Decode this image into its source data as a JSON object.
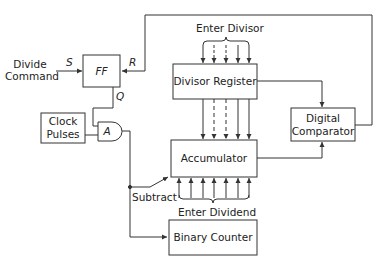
{
  "diagram": {
    "blocks": {
      "flip_flop": {
        "label": "FF",
        "set_input": "S",
        "reset_input": "R",
        "output": "Q"
      },
      "clock": {
        "label_line1": "Clock",
        "label_line2": "Pulses"
      },
      "and_gate": {
        "label": "A"
      },
      "divisor_register": {
        "label": "Divisor Register"
      },
      "accumulator": {
        "label": "Accumulator"
      },
      "binary_counter": {
        "label": "Binary Counter"
      },
      "comparator": {
        "label_line1": "Digital",
        "label_line2": "Comparator"
      }
    },
    "labels": {
      "divide_command_line1": "Divide",
      "divide_command_line2": "Command",
      "enter_divisor": "Enter Divisor",
      "enter_dividend": "Enter Dividend",
      "subtract": "Subtract"
    },
    "bus_lines": {
      "divisor_inputs": 5,
      "register_transfer_lines": 5,
      "dividend_inputs": 7
    },
    "colors": {
      "line": "#333333",
      "background": "#ffffff"
    }
  }
}
